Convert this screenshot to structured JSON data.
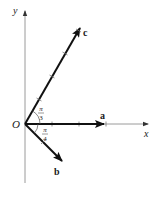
{
  "figure": {
    "axes": {
      "x_label": "x",
      "y_label": "y",
      "origin_label": "O"
    },
    "vectors": [
      {
        "name": "a",
        "label": "a",
        "angle_deg": 0,
        "length_units": 3
      },
      {
        "name": "b",
        "label": "b",
        "angle_deg": -45,
        "length_units": 2
      },
      {
        "name": "c",
        "label": "c",
        "angle_deg": 60,
        "length_units": 4
      }
    ],
    "angles": [
      {
        "between": [
          "a",
          "c"
        ],
        "numerator": "π",
        "denominator": "3"
      },
      {
        "between": [
          "a",
          "b"
        ],
        "numerator": "π",
        "denominator": "4"
      }
    ],
    "colors": {
      "axis": "#9a9a9a",
      "vector": "#111111",
      "text": "#1a1a1a"
    }
  }
}
